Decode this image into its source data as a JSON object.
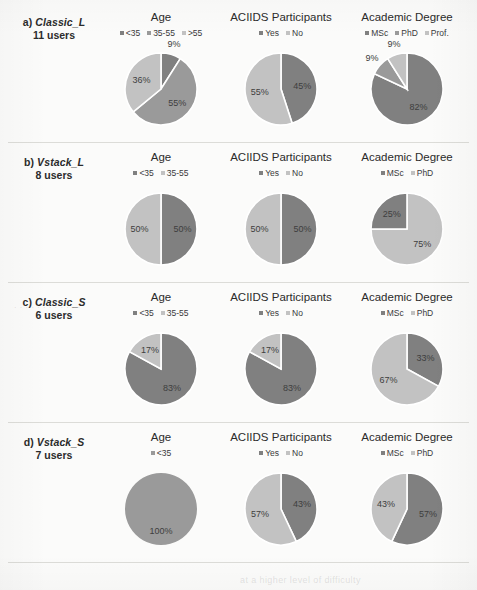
{
  "figure": {
    "background": "#fbfbfa",
    "column_titles": [
      "Age",
      "ACIIDS Participants",
      "Academic Degree"
    ],
    "colors": {
      "dark": "#808080",
      "medium": "#9a9a9a",
      "light": "#c2c2c2",
      "separator": "#dcdcd8",
      "slice_gap": "#ffffff"
    },
    "bottom_caption": "at a higher level of difficulty"
  },
  "rows": [
    {
      "id": "a)",
      "name": "Classic_L",
      "users": "11 users",
      "charts": [
        {
          "title": "Age",
          "legend": [
            {
              "label": "<35",
              "color": "#808080"
            },
            {
              "label": "35-55",
              "color": "#9a9a9a"
            },
            {
              "label": ">55",
              "color": "#c2c2c2"
            }
          ],
          "labels": [
            "9%",
            "55%",
            "36%"
          ]
        },
        {
          "title": "ACIIDS Participants",
          "legend": [
            {
              "label": "Yes",
              "color": "#808080"
            },
            {
              "label": "No",
              "color": "#c2c2c2"
            }
          ],
          "labels": [
            "45%",
            "55%"
          ]
        },
        {
          "title": "Academic Degree",
          "legend": [
            {
              "label": "MSc",
              "color": "#808080"
            },
            {
              "label": "PhD",
              "color": "#9a9a9a"
            },
            {
              "label": "Prof.",
              "color": "#c2c2c2"
            }
          ],
          "labels": [
            "82%",
            "9%",
            "9%"
          ]
        }
      ]
    },
    {
      "id": "b)",
      "name": "Vstack_L",
      "users": "8 users",
      "charts": [
        {
          "title": "Age",
          "legend": [
            {
              "label": "<35",
              "color": "#808080"
            },
            {
              "label": "35-55",
              "color": "#c2c2c2"
            }
          ],
          "labels": [
            "50%",
            "50%"
          ]
        },
        {
          "title": "ACIIDS Participants",
          "legend": [
            {
              "label": "Yes",
              "color": "#808080"
            },
            {
              "label": "No",
              "color": "#c2c2c2"
            }
          ],
          "labels": [
            "50%",
            "50%"
          ]
        },
        {
          "title": "Academic Degree",
          "legend": [
            {
              "label": "MSc",
              "color": "#808080"
            },
            {
              "label": "PhD",
              "color": "#c2c2c2"
            }
          ],
          "labels": [
            "25%",
            "75%"
          ]
        }
      ]
    },
    {
      "id": "c)",
      "name": "Classic_S",
      "users": "6 users",
      "charts": [
        {
          "title": "Age",
          "legend": [
            {
              "label": "<35",
              "color": "#808080"
            },
            {
              "label": "35-55",
              "color": "#c2c2c2"
            }
          ],
          "labels": [
            "83%",
            "17%"
          ]
        },
        {
          "title": "ACIIDS Participants",
          "legend": [
            {
              "label": "Yes",
              "color": "#808080"
            },
            {
              "label": "No",
              "color": "#c2c2c2"
            }
          ],
          "labels": [
            "83%",
            "17%"
          ]
        },
        {
          "title": "Academic Degree",
          "legend": [
            {
              "label": "MSc",
              "color": "#808080"
            },
            {
              "label": "PhD",
              "color": "#c2c2c2"
            }
          ],
          "labels": [
            "33%",
            "67%"
          ]
        }
      ]
    },
    {
      "id": "d)",
      "name": "Vstack_S",
      "users": "7 users",
      "charts": [
        {
          "title": "Age",
          "legend": [
            {
              "label": "<35",
              "color": "#9a9a9a"
            }
          ],
          "labels": [
            "100%"
          ]
        },
        {
          "title": "ACIIDS Participants",
          "legend": [
            {
              "label": "Yes",
              "color": "#808080"
            },
            {
              "label": "No",
              "color": "#c2c2c2"
            }
          ],
          "labels": [
            "43%",
            "57%"
          ]
        },
        {
          "title": "Academic Degree",
          "legend": [
            {
              "label": "MSc",
              "color": "#808080"
            },
            {
              "label": "PhD",
              "color": "#c2c2c2"
            }
          ],
          "labels": [
            "57%",
            "43%"
          ]
        }
      ]
    }
  ],
  "chart_data": [
    {
      "type": "pie",
      "title": "Age",
      "group": "a) Classic_L (11 users)",
      "categories": [
        "<35",
        "35-55",
        ">55"
      ],
      "values": [
        9,
        55,
        36
      ],
      "value_labels": [
        "9%",
        "55%",
        "36%"
      ],
      "colors": [
        "#808080",
        "#9a9a9a",
        "#c2c2c2"
      ],
      "legend_position": "top",
      "start_angle_deg": 0
    },
    {
      "type": "pie",
      "title": "ACIIDS Participants",
      "group": "a) Classic_L (11 users)",
      "categories": [
        "Yes",
        "No"
      ],
      "values": [
        45,
        55
      ],
      "value_labels": [
        "45%",
        "55%"
      ],
      "colors": [
        "#808080",
        "#c2c2c2"
      ],
      "legend_position": "top",
      "start_angle_deg": 0
    },
    {
      "type": "pie",
      "title": "Academic Degree",
      "group": "a) Classic_L (11 users)",
      "categories": [
        "MSc",
        "PhD",
        "Prof."
      ],
      "values": [
        82,
        9,
        9
      ],
      "value_labels": [
        "82%",
        "9%",
        "9%"
      ],
      "colors": [
        "#808080",
        "#9a9a9a",
        "#c2c2c2"
      ],
      "legend_position": "top",
      "start_angle_deg": 0
    },
    {
      "type": "pie",
      "title": "Age",
      "group": "b) Vstack_L (8 users)",
      "categories": [
        "<35",
        "35-55"
      ],
      "values": [
        50,
        50
      ],
      "value_labels": [
        "50%",
        "50%"
      ],
      "colors": [
        "#808080",
        "#c2c2c2"
      ],
      "legend_position": "top",
      "start_angle_deg": 0
    },
    {
      "type": "pie",
      "title": "ACIIDS Participants",
      "group": "b) Vstack_L (8 users)",
      "categories": [
        "Yes",
        "No"
      ],
      "values": [
        50,
        50
      ],
      "value_labels": [
        "50%",
        "50%"
      ],
      "colors": [
        "#808080",
        "#c2c2c2"
      ],
      "legend_position": "top",
      "start_angle_deg": 0
    },
    {
      "type": "pie",
      "title": "Academic Degree",
      "group": "b) Vstack_L (8 users)",
      "categories": [
        "MSc",
        "PhD"
      ],
      "values": [
        75,
        25
      ],
      "value_labels": [
        "75%",
        "25%"
      ],
      "colors": [
        "#c2c2c2",
        "#808080"
      ],
      "legend_position": "top",
      "start_angle_deg": 0
    },
    {
      "type": "pie",
      "title": "Age",
      "group": "c) Classic_S (6 users)",
      "categories": [
        "<35",
        "35-55"
      ],
      "values": [
        83,
        17
      ],
      "value_labels": [
        "83%",
        "17%"
      ],
      "colors": [
        "#808080",
        "#c2c2c2"
      ],
      "legend_position": "top",
      "start_angle_deg": 0
    },
    {
      "type": "pie",
      "title": "ACIIDS Participants",
      "group": "c) Classic_S (6 users)",
      "categories": [
        "Yes",
        "No"
      ],
      "values": [
        83,
        17
      ],
      "value_labels": [
        "83%",
        "17%"
      ],
      "colors": [
        "#808080",
        "#c2c2c2"
      ],
      "legend_position": "top",
      "start_angle_deg": 0
    },
    {
      "type": "pie",
      "title": "Academic Degree",
      "group": "c) Classic_S (6 users)",
      "categories": [
        "MSc",
        "PhD"
      ],
      "values": [
        33,
        67
      ],
      "value_labels": [
        "33%",
        "67%"
      ],
      "colors": [
        "#808080",
        "#c2c2c2"
      ],
      "legend_position": "top",
      "start_angle_deg": 0
    },
    {
      "type": "pie",
      "title": "Age",
      "group": "d) Vstack_S (7 users)",
      "categories": [
        "<35"
      ],
      "values": [
        100
      ],
      "value_labels": [
        "100%"
      ],
      "colors": [
        "#9a9a9a"
      ],
      "legend_position": "top",
      "start_angle_deg": 0
    },
    {
      "type": "pie",
      "title": "ACIIDS Participants",
      "group": "d) Vstack_S (7 users)",
      "categories": [
        "Yes",
        "No"
      ],
      "values": [
        43,
        57
      ],
      "value_labels": [
        "43%",
        "57%"
      ],
      "colors": [
        "#808080",
        "#c2c2c2"
      ],
      "legend_position": "top",
      "start_angle_deg": 0
    },
    {
      "type": "pie",
      "title": "Academic Degree",
      "group": "d) Vstack_S (7 users)",
      "categories": [
        "MSc",
        "PhD"
      ],
      "values": [
        57,
        43
      ],
      "value_labels": [
        "57%",
        "43%"
      ],
      "colors": [
        "#808080",
        "#c2c2c2"
      ],
      "legend_position": "top",
      "start_angle_deg": 0
    }
  ]
}
